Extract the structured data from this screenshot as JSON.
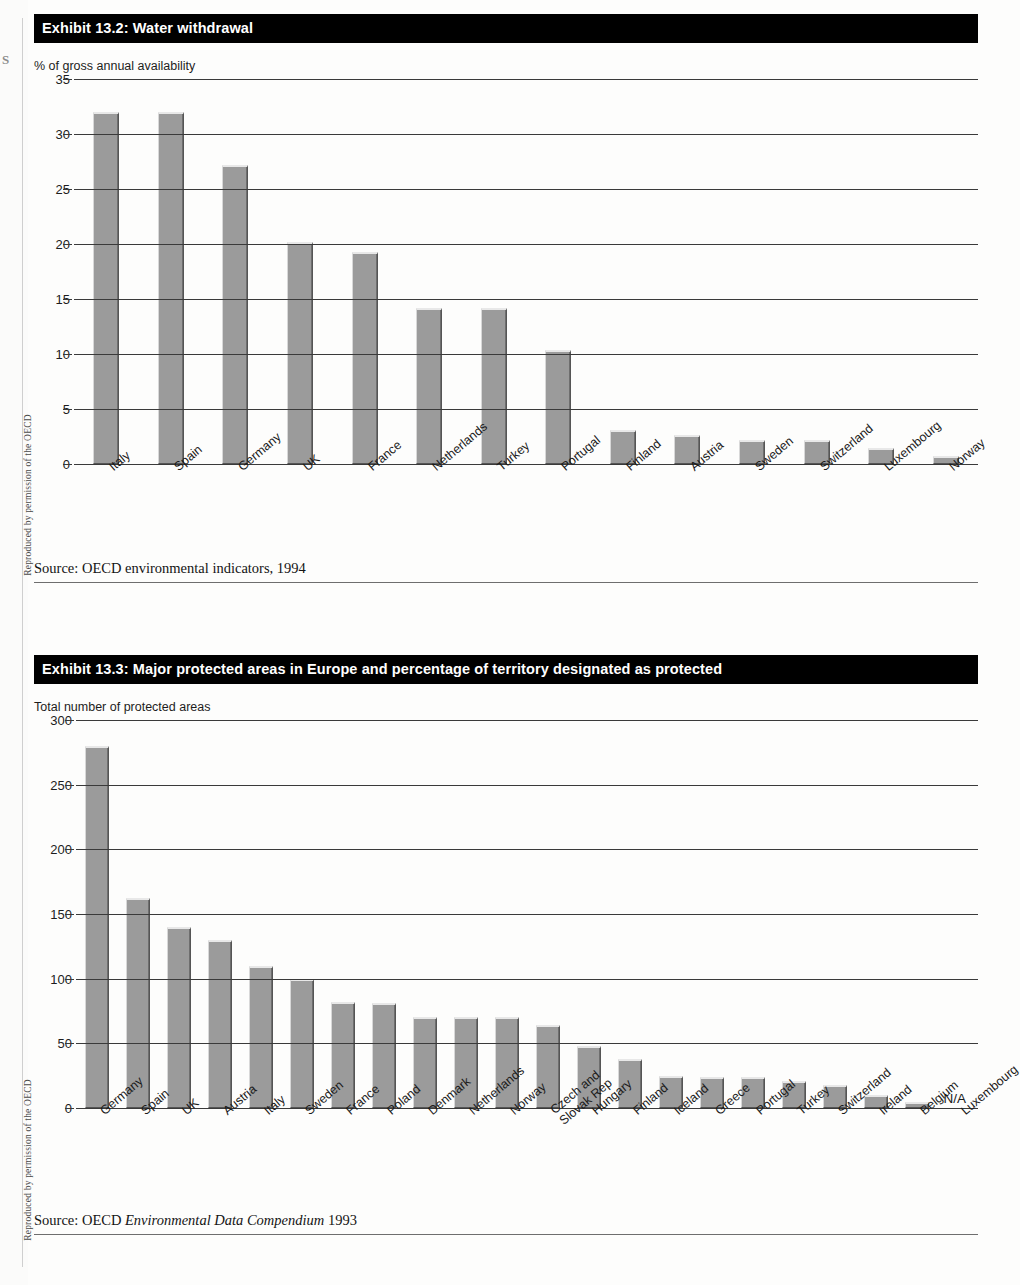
{
  "page": {
    "margin_credit": "Reproduced by permission of the OECD",
    "folio": "S"
  },
  "exhibit_1": {
    "title": "Exhibit 13.2: Water withdrawal",
    "axis_caption": "% of gross annual availability",
    "source_prefix": "Source:  OECD environmental indicators, 1994",
    "source_plain": "Source:  OECD environmental indicators, 1994"
  },
  "exhibit_2": {
    "title": "Exhibit 13.3: Major protected areas in Europe and percentage of territory designated as protected",
    "axis_caption": "Total number of protected areas",
    "source_lead": "Source: OECD ",
    "source_italic": "Environmental Data Compendium",
    "source_tail": " 1993",
    "na_label": "N/A"
  },
  "chart_data": [
    {
      "type": "bar",
      "title": "Exhibit 13.2: Water withdrawal",
      "xlabel": "",
      "ylabel": "% of gross annual availability",
      "ylim": [
        0,
        35
      ],
      "yticks": [
        0,
        5,
        10,
        15,
        20,
        25,
        30,
        35
      ],
      "grid": true,
      "legend": "none",
      "bar_color": "#9b9b9b",
      "categories": [
        "Italy",
        "Spain",
        "Germany",
        "UK",
        "France",
        "Netherlands",
        "Turkey",
        "Portugal",
        "Finland",
        "Austria",
        "Sweden",
        "Switzerland",
        "Luxembourg",
        "Norway"
      ],
      "values": [
        32.0,
        32.0,
        27.2,
        20.2,
        19.3,
        14.2,
        14.2,
        10.4,
        3.1,
        2.6,
        2.2,
        2.2,
        1.5,
        0.7
      ]
    },
    {
      "type": "bar",
      "title": "Exhibit 13.3: Major protected areas in Europe and percentage of territory designated as protected",
      "xlabel": "",
      "ylabel": "Total number of protected areas",
      "ylim": [
        0,
        300
      ],
      "yticks": [
        0,
        50,
        100,
        150,
        200,
        250,
        300
      ],
      "grid": true,
      "legend": "none",
      "bar_color": "#9b9b9b",
      "categories": [
        "Germany",
        "Spain",
        "UK",
        "Austria",
        "Italy",
        "Sweden",
        "France",
        "Poland",
        "Denmark",
        "Netherlands",
        "Norway",
        "Czech and Slovak Rep",
        "Hungary",
        "Finland",
        "Iceland",
        "Greece",
        "Portugal",
        "Turkey",
        "Switzerland",
        "Ireland",
        "Belgium",
        "Luxembourg"
      ],
      "values": [
        280,
        162,
        140,
        130,
        110,
        100,
        82,
        81,
        70,
        70,
        70,
        64,
        48,
        38,
        25,
        24,
        24,
        21,
        18,
        10,
        5,
        null
      ],
      "null_label": "N/A"
    }
  ]
}
